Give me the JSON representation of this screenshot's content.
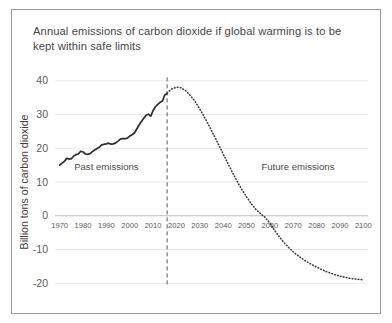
{
  "chart_data": {
    "type": "line",
    "title": "Annual emissions of carbon dioxide if global warming is to be kept within safe limits",
    "xlabel": "",
    "ylabel": "Billion tons of carbon dioxide",
    "xlim": [
      1968,
      2102
    ],
    "ylim": [
      -22,
      42
    ],
    "grid": true,
    "legend": "none",
    "xticks": [
      1970,
      1980,
      1990,
      2000,
      2010,
      2020,
      2030,
      2040,
      2050,
      2060,
      2070,
      2080,
      2090,
      2100
    ],
    "xtick_labels": [
      "1970",
      "1980",
      "1990",
      "2000",
      "2010",
      "2020",
      "2030",
      "2040",
      "2050",
      "2060",
      "2070",
      "2080",
      "2090",
      "2100"
    ],
    "yticks": [
      40,
      30,
      20,
      10,
      0,
      -10,
      -20
    ],
    "ytick_labels": [
      "40",
      "30",
      "20",
      "10",
      "0",
      "-10",
      "-20"
    ],
    "annotations": [
      {
        "text": "Past emissions",
        "x": 1990,
        "y": 13.5
      },
      {
        "text": "Future emissions",
        "x": 2072,
        "y": 13.5
      }
    ],
    "divider": {
      "x": 2016,
      "style": "dashed",
      "y_top": 41,
      "y_bottom": -21
    },
    "series": [
      {
        "name": "Past emissions",
        "style": "solid",
        "x": [
          1970,
          1971,
          1972,
          1973,
          1974,
          1975,
          1976,
          1977,
          1978,
          1979,
          1980,
          1981,
          1982,
          1983,
          1984,
          1985,
          1986,
          1987,
          1988,
          1989,
          1990,
          1991,
          1992,
          1993,
          1994,
          1995,
          1996,
          1997,
          1998,
          1999,
          2000,
          2001,
          2002,
          2003,
          2004,
          2005,
          2006,
          2007,
          2008,
          2009,
          2010,
          2011,
          2012,
          2013,
          2014,
          2015,
          2016
        ],
        "y": [
          15.0,
          15.6,
          16.1,
          17.0,
          16.8,
          16.9,
          17.7,
          18.1,
          18.3,
          19.1,
          18.9,
          18.3,
          18.2,
          18.4,
          19.0,
          19.5,
          19.9,
          20.3,
          21.0,
          21.2,
          21.3,
          21.5,
          21.2,
          21.3,
          21.6,
          22.1,
          22.7,
          22.9,
          22.8,
          23.0,
          23.6,
          24.0,
          24.5,
          25.7,
          26.9,
          27.9,
          28.9,
          29.8,
          30.1,
          29.5,
          31.2,
          32.3,
          33.0,
          33.6,
          34.0,
          35.8,
          36.2
        ]
      },
      {
        "name": "Future emissions",
        "style": "dotted",
        "x": [
          2016,
          2018,
          2020,
          2022,
          2024,
          2026,
          2028,
          2030,
          2032,
          2034,
          2036,
          2038,
          2040,
          2042,
          2044,
          2046,
          2048,
          2050,
          2052,
          2054,
          2056,
          2058,
          2060,
          2062,
          2064,
          2066,
          2068,
          2070,
          2072,
          2074,
          2076,
          2078,
          2080,
          2082,
          2084,
          2086,
          2088,
          2090,
          2092,
          2094,
          2096,
          2098,
          2100
        ],
        "y": [
          36.4,
          37.6,
          38.1,
          37.9,
          37.0,
          35.6,
          33.8,
          31.6,
          29.2,
          26.6,
          23.9,
          21.1,
          18.3,
          15.5,
          12.8,
          10.2,
          7.8,
          5.6,
          3.6,
          1.9,
          0.6,
          -0.5,
          -2.2,
          -4.3,
          -6.2,
          -7.9,
          -9.4,
          -10.7,
          -11.8,
          -12.8,
          -13.7,
          -14.5,
          -15.2,
          -15.9,
          -16.5,
          -17.0,
          -17.5,
          -17.9,
          -18.2,
          -18.5,
          -18.7,
          -18.85,
          -18.95
        ]
      }
    ]
  }
}
